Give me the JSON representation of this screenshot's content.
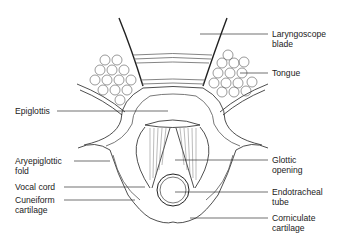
{
  "figure": {
    "labels": {
      "laryngoscope_blade": "Laryngoscope\nblade",
      "tongue": "Tongue",
      "epiglottis": "Epiglottis",
      "aryepiglottic_fold": "Aryepiglottic\nfold",
      "vocal_cord": "Vocal cord",
      "cuneiform_cartilage": "Cuneiform\ncartilage",
      "glottic_opening": "Glottic\nopening",
      "endotracheal_tube": "Endotracheal\ntube",
      "corniculate_cartilage": "Corniculate\ncartilage"
    },
    "colors": {
      "line": "#222222",
      "light_line": "#777777",
      "text": "#222222",
      "background": "#ffffff"
    }
  }
}
